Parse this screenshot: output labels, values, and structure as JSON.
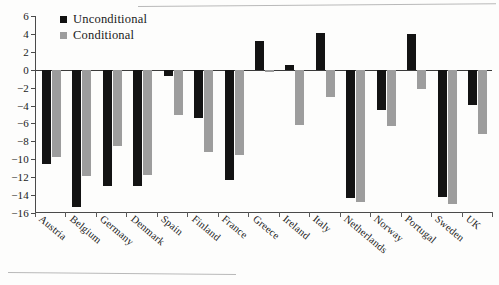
{
  "figure": {
    "legend": [
      {
        "key": "unconditional",
        "label": "Unconditional",
        "color": "#131313"
      },
      {
        "key": "conditional",
        "label": "Conditional",
        "color": "#9d9d9d"
      }
    ]
  },
  "chart_data": {
    "type": "bar",
    "title": "",
    "xlabel": "",
    "ylabel": "",
    "ylim": [
      -16,
      6
    ],
    "yticks": [
      6,
      4,
      2,
      0,
      -2,
      -4,
      -6,
      -8,
      -10,
      -12,
      -14,
      -16
    ],
    "ytick_labels": [
      "6",
      "4",
      "2",
      "0",
      "−2",
      "−4",
      "−6",
      "−8",
      "−10",
      "−12",
      "−14",
      "−16"
    ],
    "grid": false,
    "legend_position": "top-left",
    "categories": [
      "Austria",
      "Belgium",
      "Germany",
      "Denmark",
      "Spain",
      "Finland",
      "France",
      "Greece",
      "Ireland",
      "Italy",
      "Netherlands",
      "Norway",
      "Portugal",
      "Sweden",
      "UK"
    ],
    "series": [
      {
        "name": "Unconditional",
        "color": "#131313",
        "values": [
          -10.5,
          -15.3,
          -13.0,
          -13.0,
          -0.7,
          -5.4,
          -12.3,
          3.2,
          0.5,
          4.1,
          -14.3,
          -4.5,
          4.0,
          -14.2,
          -3.9
        ]
      },
      {
        "name": "Conditional",
        "color": "#9d9d9d",
        "values": [
          -9.7,
          -11.9,
          -8.5,
          -11.8,
          -5.1,
          -9.2,
          -9.5,
          -0.3,
          -6.2,
          -3.0,
          -14.8,
          -6.3,
          -2.1,
          -15.0,
          -7.2
        ]
      }
    ]
  }
}
